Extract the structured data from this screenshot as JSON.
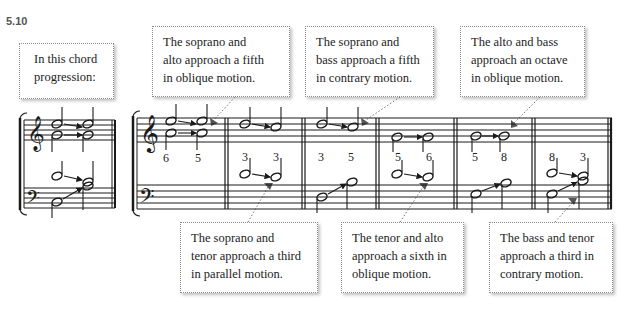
{
  "figure": {
    "number": "5.10",
    "intro_callout": [
      "In this chord",
      "progression:"
    ],
    "top_callouts": [
      [
        "The soprano and",
        "alto approach a fifth",
        "in oblique motion."
      ],
      [
        "The soprano and",
        "bass approach a fifth",
        "in contrary motion."
      ],
      [
        "The alto and bass",
        "approach an octave",
        "in oblique motion."
      ]
    ],
    "bottom_callouts": [
      [
        "The soprano and",
        "tenor approach a third",
        "in parallel motion."
      ],
      [
        "The tenor and alto",
        "approach a sixth in",
        "oblique motion."
      ],
      [
        "The bass and tenor",
        "approach a third in",
        "contrary motion."
      ]
    ],
    "interval_labels": [
      {
        "measure": 1,
        "labels": [
          "6",
          "5"
        ]
      },
      {
        "measure": 2,
        "labels": [
          "3",
          "3"
        ]
      },
      {
        "measure": 3,
        "labels": [
          "3",
          "5"
        ]
      },
      {
        "measure": 4,
        "labels": [
          "5",
          "6"
        ]
      },
      {
        "measure": 5,
        "labels": [
          "5",
          "8"
        ]
      },
      {
        "measure": 6,
        "labels": [
          "8",
          "3"
        ]
      }
    ],
    "colors": {
      "ink": "#1a1a1a",
      "arrow_marker": "#555555",
      "callout_border": "#8a8a8a"
    }
  }
}
